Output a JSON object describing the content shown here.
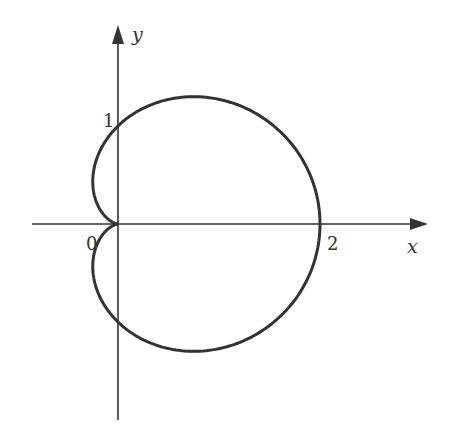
{
  "chart_data": {
    "type": "line",
    "title": "",
    "xlabel": "x",
    "ylabel": "y",
    "series": [
      {
        "name": "cardioid r = 1 + cos(theta)",
        "equation": "r = 1 + cos(theta)",
        "theta_range": [
          0,
          6.2832
        ]
      }
    ],
    "tick_labels": {
      "x": [
        {
          "value": 0,
          "label": "0"
        },
        {
          "value": 2,
          "label": "2"
        }
      ],
      "y": [
        {
          "value": 1,
          "label": "1"
        }
      ]
    },
    "key_points": [
      {
        "x": 2,
        "y": 0
      },
      {
        "x": 0,
        "y": 1
      },
      {
        "x": 0,
        "y": -1
      },
      {
        "x": 0,
        "y": 0
      },
      {
        "x": 0.75,
        "y": 1.299
      },
      {
        "x": 0.75,
        "y": -1.299
      }
    ],
    "xlim": [
      -0.85,
      3.1
    ],
    "ylim": [
      -2.0,
      2.0
    ],
    "grid": false,
    "legend": "none",
    "colors": {
      "curve": "#333333",
      "axes": "#333333"
    }
  },
  "labels": {
    "x_axis": "x",
    "y_axis": "y",
    "origin": "0",
    "x_tick_2": "2",
    "y_tick_1": "1"
  }
}
